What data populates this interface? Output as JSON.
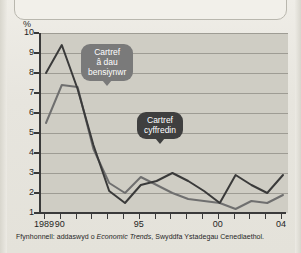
{
  "chart_data": {
    "type": "line",
    "title": "",
    "xlabel": "",
    "ylabel": "%",
    "ylim": [
      1,
      10
    ],
    "xlim": [
      1989,
      2004
    ],
    "grid": true,
    "legend_position": "annotations",
    "yticks": [
      10,
      9,
      8,
      7,
      6,
      5,
      4,
      3,
      2,
      1
    ],
    "xticks": [
      1989,
      1990,
      1991,
      1992,
      1993,
      1994,
      1995,
      1996,
      1997,
      1998,
      1999,
      2000,
      2001,
      2002,
      2003,
      2004
    ],
    "xtick_labels": [
      "1989",
      "90",
      "",
      "",
      "",
      "",
      "95",
      "",
      "",
      "",
      "",
      "00",
      "",
      "",
      "",
      "04"
    ],
    "x": [
      1989,
      1990,
      1991,
      1992,
      1993,
      1994,
      1995,
      1996,
      1997,
      1998,
      1999,
      2000,
      2001,
      2002,
      2003,
      2004
    ],
    "series": [
      {
        "name": "Cartref â dau bensiynwr",
        "color": "#3a3a3a",
        "values": [
          8.0,
          9.4,
          7.2,
          4.4,
          2.1,
          1.5,
          2.4,
          2.6,
          3.0,
          2.6,
          2.1,
          1.5,
          2.9,
          2.4,
          2.0,
          2.9
        ]
      },
      {
        "name": "Cartref cyffredin",
        "color": "#6f6f6f",
        "values": [
          5.5,
          7.4,
          7.3,
          4.2,
          2.5,
          2.0,
          2.8,
          2.4,
          2.0,
          1.7,
          1.6,
          1.5,
          1.2,
          1.6,
          1.5,
          1.9
        ]
      }
    ],
    "annotations": [
      {
        "text_line1": "Cartref",
        "text_line2": "â dau",
        "text_line3": "bensiynwr",
        "target_series": "Cartref â dau bensiynwr"
      },
      {
        "text_line1": "Cartref",
        "text_line2": "cyffredin",
        "target_series": "Cartref cyffredin"
      }
    ]
  },
  "axis": {
    "unit_label": "%",
    "y_labels": [
      "10",
      "9",
      "8",
      "7",
      "6",
      "5",
      "4",
      "3",
      "2",
      "1"
    ],
    "x_labels": [
      {
        "text": "1989",
        "year": 1989
      },
      {
        "text": "90",
        "year": 1990
      },
      {
        "text": "95",
        "year": 1995
      },
      {
        "text": "00",
        "year": 2000
      },
      {
        "text": "04",
        "year": 2004
      }
    ]
  },
  "callouts": {
    "pensioner": {
      "line1": "Cartref",
      "line2": "â dau",
      "line3": "bensiynwr",
      "color": "#7a7a7a"
    },
    "average": {
      "line1": "Cartref",
      "line2": "cyffredin",
      "color": "#3f3f3f"
    }
  },
  "footer": {
    "source_prefix": "Ffynhonnell: addaswyd o ",
    "source_italic": "Economic Trends",
    "source_suffix": ", Swyddfa Ystadegau Cenedlaethol."
  },
  "colors": {
    "series_dark": "#3a3a3a",
    "series_light": "#6f6f6f",
    "plot_background": "#cfcdc4",
    "page_background": "#e9e7e0",
    "gridline": "#9e9c94"
  }
}
